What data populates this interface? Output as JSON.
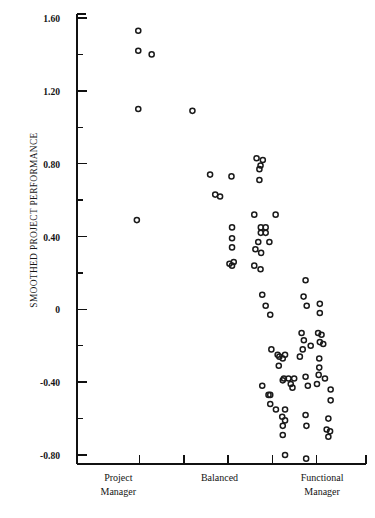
{
  "chart_data": {
    "type": "scatter",
    "title": "",
    "xlabel": "",
    "ylabel": "SMOOTHED PROJECT PERFORMANCE",
    "ylim": [
      -0.92,
      1.62
    ],
    "yticks": [
      1.6,
      1.2,
      0.8,
      0.4,
      0,
      -0.4,
      -0.8
    ],
    "ytick_labels": [
      "1.60",
      "1.20",
      "0.80",
      "0.40",
      "0",
      "-0.40",
      "-0.80"
    ],
    "y_minor_ticks": [
      1.4,
      1.0,
      0.6,
      0.2,
      -0.2,
      -0.6
    ],
    "grid": false,
    "legend": null,
    "xlim": [
      0,
      10
    ],
    "x_category_labels": [
      {
        "label_lines": [
          "Project",
          "Manager"
        ],
        "x": 1.45
      },
      {
        "label_lines": [
          "Balanced"
        ],
        "x": 5.0
      },
      {
        "label_lines": [
          "Functional",
          "Manager"
        ],
        "x": 8.6
      }
    ],
    "x_tick_positions": [
      2.2,
      3.75,
      5.3,
      6.85,
      8.4
    ],
    "marker": "open-circle",
    "marker_color": "#1a1a1a",
    "points": [
      {
        "x": 2.15,
        "y": 1.53
      },
      {
        "x": 2.15,
        "y": 1.42
      },
      {
        "x": 2.62,
        "y": 1.4
      },
      {
        "x": 2.15,
        "y": 1.1
      },
      {
        "x": 4.05,
        "y": 1.09
      },
      {
        "x": 2.1,
        "y": 0.49
      },
      {
        "x": 4.67,
        "y": 0.74
      },
      {
        "x": 5.42,
        "y": 0.73
      },
      {
        "x": 4.85,
        "y": 0.63
      },
      {
        "x": 5.02,
        "y": 0.62
      },
      {
        "x": 6.22,
        "y": 0.52
      },
      {
        "x": 5.44,
        "y": 0.45
      },
      {
        "x": 5.44,
        "y": 0.39
      },
      {
        "x": 5.44,
        "y": 0.34
      },
      {
        "x": 5.35,
        "y": 0.25
      },
      {
        "x": 5.5,
        "y": 0.26
      },
      {
        "x": 5.44,
        "y": 0.24
      },
      {
        "x": 6.22,
        "y": 0.24
      },
      {
        "x": 6.3,
        "y": 0.83
      },
      {
        "x": 6.52,
        "y": 0.82
      },
      {
        "x": 6.44,
        "y": 0.79
      },
      {
        "x": 6.4,
        "y": 0.77
      },
      {
        "x": 6.4,
        "y": 0.71
      },
      {
        "x": 6.97,
        "y": 0.52
      },
      {
        "x": 6.45,
        "y": 0.45
      },
      {
        "x": 6.62,
        "y": 0.45
      },
      {
        "x": 6.45,
        "y": 0.42
      },
      {
        "x": 6.62,
        "y": 0.42
      },
      {
        "x": 6.36,
        "y": 0.37
      },
      {
        "x": 6.75,
        "y": 0.37
      },
      {
        "x": 6.26,
        "y": 0.33
      },
      {
        "x": 6.46,
        "y": 0.31
      },
      {
        "x": 6.44,
        "y": 0.22
      },
      {
        "x": 6.5,
        "y": 0.08
      },
      {
        "x": 6.62,
        "y": 0.02
      },
      {
        "x": 6.78,
        "y": -0.03
      },
      {
        "x": 6.82,
        "y": -0.22
      },
      {
        "x": 7.04,
        "y": -0.25
      },
      {
        "x": 7.1,
        "y": -0.26
      },
      {
        "x": 7.22,
        "y": -0.27
      },
      {
        "x": 7.3,
        "y": -0.25
      },
      {
        "x": 7.08,
        "y": -0.31
      },
      {
        "x": 6.5,
        "y": -0.42
      },
      {
        "x": 6.72,
        "y": -0.47
      },
      {
        "x": 6.78,
        "y": -0.47
      },
      {
        "x": 6.78,
        "y": -0.52
      },
      {
        "x": 7.22,
        "y": -0.39
      },
      {
        "x": 7.3,
        "y": -0.55
      },
      {
        "x": 7.3,
        "y": -0.61
      },
      {
        "x": 7.3,
        "y": -0.8
      },
      {
        "x": 8.02,
        "y": 0.16
      },
      {
        "x": 7.95,
        "y": 0.07
      },
      {
        "x": 8.06,
        "y": 0.02
      },
      {
        "x": 8.52,
        "y": 0.03
      },
      {
        "x": 8.52,
        "y": -0.02
      },
      {
        "x": 7.88,
        "y": -0.13
      },
      {
        "x": 7.96,
        "y": -0.17
      },
      {
        "x": 7.92,
        "y": -0.22
      },
      {
        "x": 8.46,
        "y": -0.13
      },
      {
        "x": 8.58,
        "y": -0.14
      },
      {
        "x": 8.52,
        "y": -0.18
      },
      {
        "x": 8.64,
        "y": -0.19
      },
      {
        "x": 8.2,
        "y": -0.2
      },
      {
        "x": 7.82,
        "y": -0.26
      },
      {
        "x": 8.5,
        "y": -0.27
      },
      {
        "x": 8.5,
        "y": -0.32
      },
      {
        "x": 7.26,
        "y": -0.38
      },
      {
        "x": 7.42,
        "y": -0.38
      },
      {
        "x": 7.5,
        "y": -0.41
      },
      {
        "x": 7.62,
        "y": -0.38
      },
      {
        "x": 7.56,
        "y": -0.43
      },
      {
        "x": 8.02,
        "y": -0.37
      },
      {
        "x": 8.1,
        "y": -0.42
      },
      {
        "x": 8.48,
        "y": -0.36
      },
      {
        "x": 8.42,
        "y": -0.41
      },
      {
        "x": 8.7,
        "y": -0.38
      },
      {
        "x": 8.9,
        "y": -0.44
      },
      {
        "x": 8.9,
        "y": -0.5
      },
      {
        "x": 6.98,
        "y": -0.55
      },
      {
        "x": 7.2,
        "y": -0.59
      },
      {
        "x": 7.22,
        "y": -0.64
      },
      {
        "x": 7.22,
        "y": -0.69
      },
      {
        "x": 8.02,
        "y": -0.58
      },
      {
        "x": 8.05,
        "y": -0.64
      },
      {
        "x": 8.82,
        "y": -0.6
      },
      {
        "x": 8.76,
        "y": -0.66
      },
      {
        "x": 8.88,
        "y": -0.67
      },
      {
        "x": 8.82,
        "y": -0.7
      },
      {
        "x": 8.04,
        "y": -0.82
      }
    ]
  }
}
